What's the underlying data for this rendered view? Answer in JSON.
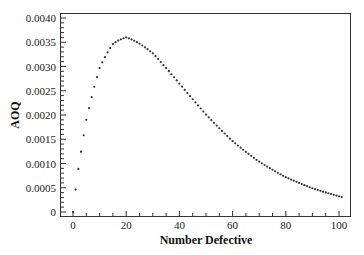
{
  "chart_data": {
    "type": "scatter",
    "title": "",
    "xlabel": "Number Defective",
    "ylabel": "AOQ",
    "xlim": [
      -3,
      104
    ],
    "ylim": [
      -0.0001,
      0.00412
    ],
    "xticks": [
      0,
      20,
      40,
      60,
      80,
      100
    ],
    "xtick_labels": [
      "0",
      "20",
      "40",
      "60",
      "80",
      "100"
    ],
    "yticks": [
      0,
      0.0005,
      0.001,
      0.0015,
      0.002,
      0.0025,
      0.003,
      0.0035,
      0.004
    ],
    "ytick_labels": [
      "0",
      "0.0005",
      "0.0010",
      "0.0015",
      "0.0020",
      "0.0025",
      "0.0030",
      "0.0035",
      "0.0040"
    ],
    "grid": false,
    "legend": null,
    "series": [
      {
        "name": "AOQ",
        "marker": "dot",
        "color": "#333333",
        "x_start": 0,
        "x_end": 101,
        "x_step": 1,
        "description": "AOQ rises from 0 at 0 defective to a peak of about 0.0036 near 20 defective, then decays to about 0.0003 at 101 defective",
        "key_points": [
          {
            "x": 0,
            "y": 0.0
          },
          {
            "x": 1,
            "y": 0.00046
          },
          {
            "x": 2,
            "y": 0.00089
          },
          {
            "x": 5,
            "y": 0.0019
          },
          {
            "x": 10,
            "y": 0.00297
          },
          {
            "x": 15,
            "y": 0.00346
          },
          {
            "x": 20,
            "y": 0.0036
          },
          {
            "x": 30,
            "y": 0.00327
          },
          {
            "x": 40,
            "y": 0.00265
          },
          {
            "x": 50,
            "y": 0.00201
          },
          {
            "x": 60,
            "y": 0.00146
          },
          {
            "x": 70,
            "y": 0.00104
          },
          {
            "x": 80,
            "y": 0.00072
          },
          {
            "x": 90,
            "y": 0.00049
          },
          {
            "x": 101,
            "y": 0.0003
          }
        ]
      }
    ]
  }
}
